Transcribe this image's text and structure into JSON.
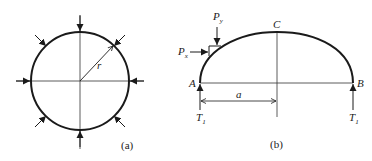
{
  "figure_a": {
    "caption": "(a)",
    "radius_label": "r"
  },
  "figure_b": {
    "caption": "(b)",
    "point_a": "A",
    "point_b": "B",
    "point_c": "C",
    "dimension_label": "a",
    "force_x": {
      "main": "P",
      "sub": "x"
    },
    "force_y": {
      "main": "P",
      "sub": "y"
    },
    "reaction_left": {
      "main": "T",
      "sub": "1"
    },
    "reaction_right": {
      "main": "T",
      "sub": "1"
    }
  },
  "colors": {
    "stroke": "#1a1a1a",
    "thin_line": "#333333",
    "background": "#ffffff"
  }
}
